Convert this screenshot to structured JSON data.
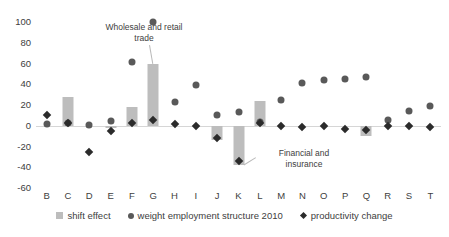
{
  "chart_data": {
    "type": "bar",
    "title": "",
    "subtitle": "",
    "xlabel": "",
    "ylabel": "",
    "ylim": [
      -60,
      100
    ],
    "yticks": [
      100,
      80,
      60,
      40,
      20,
      0,
      -20,
      -40,
      -60
    ],
    "ytick_labels": [
      "100",
      "80",
      "60",
      "40",
      "20",
      "0",
      "-20",
      "-40",
      "-60"
    ],
    "grid": false,
    "legend_position": "bottom",
    "categories": [
      "B",
      "C",
      "D",
      "E",
      "F",
      "G",
      "H",
      "I",
      "J",
      "K",
      "L",
      "M",
      "N",
      "O",
      "P",
      "Q",
      "R",
      "S",
      "T"
    ],
    "series": [
      {
        "name": "shift effect",
        "mark": "bar",
        "color": "#bdbdbd",
        "values": [
          0,
          28,
          0,
          -2,
          18,
          60,
          0,
          0,
          -14,
          -38,
          24,
          0,
          0,
          0,
          0,
          -10,
          0,
          0,
          0
        ]
      },
      {
        "name": "weight employment structure 2010",
        "mark": "circle",
        "color": "#595959",
        "values": [
          2,
          3,
          1,
          5,
          61,
          100,
          23,
          39,
          10,
          13,
          4,
          25,
          41,
          44,
          45,
          47,
          6,
          14,
          19
        ]
      },
      {
        "name": "productivity change",
        "mark": "diamond",
        "color": "#2b2b2b",
        "values": [
          10,
          3,
          -25,
          -5,
          3,
          6,
          2,
          0,
          -12,
          -34,
          3,
          0,
          -1,
          0,
          -3,
          -4,
          0,
          0,
          -1
        ]
      }
    ],
    "annotations": [
      {
        "text": "Wholesale and retail\ntrade",
        "target_category": "G"
      },
      {
        "text": "Financial and\ninsurance",
        "target_category": "K"
      }
    ]
  },
  "legend": {
    "items": [
      {
        "label": "shift effect",
        "marker": "square-swatch-icon"
      },
      {
        "label": "weight employment structure 2010",
        "marker": "circle-swatch-icon"
      },
      {
        "label": "productivity change",
        "marker": "diamond-swatch-icon"
      }
    ]
  }
}
